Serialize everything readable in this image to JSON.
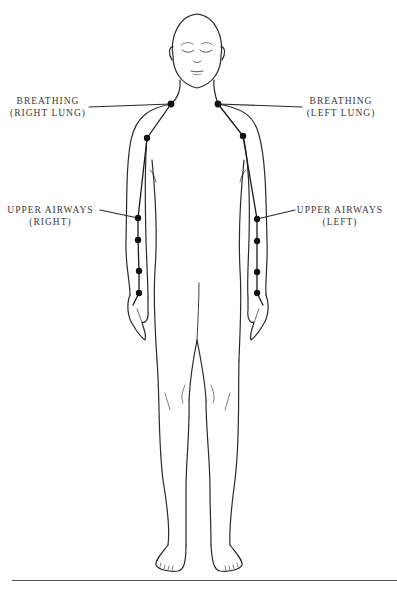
{
  "diagram": {
    "type": "anatomical-meridian-diagram",
    "labels": [
      {
        "id": "breathing-right-lung",
        "line1": "BREATHING",
        "line2": "(RIGHT LUNG)",
        "side": "right"
      },
      {
        "id": "breathing-left-lung",
        "line1": "BREATHING",
        "line2": "(LEFT LUNG)",
        "side": "left"
      },
      {
        "id": "upper-airways-right",
        "line1": "UPPER AIRWAYS",
        "line2": "(RIGHT)",
        "side": "right"
      },
      {
        "id": "upper-airways-left",
        "line1": "UPPER AIRWAYS",
        "line2": "(LEFT)",
        "side": "left"
      }
    ],
    "points": {
      "right_arm": [
        [
          171,
          104
        ],
        [
          147,
          138
        ],
        [
          138,
          218
        ],
        [
          138,
          240
        ],
        [
          139,
          271
        ],
        [
          139,
          293
        ]
      ],
      "left_arm": [
        [
          218,
          104
        ],
        [
          243,
          136
        ],
        [
          257,
          219
        ],
        [
          257,
          241
        ],
        [
          257,
          272
        ],
        [
          257,
          293
        ]
      ]
    },
    "colors": {
      "line": "#2a2a2a",
      "dot": "#111111",
      "label_text": "#3a3a3a",
      "background": "#ffffff"
    }
  }
}
